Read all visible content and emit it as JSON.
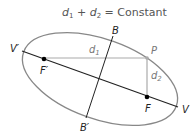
{
  "title": {
    "d1": "d",
    "d1_sub": "1",
    "plus": " + ",
    "d2": "d",
    "d2_sub": "2",
    "rest": " = Constant"
  },
  "labels": {
    "vertex_left": "V′",
    "vertex_right": "V",
    "focus_left": "F′",
    "focus_right": "F",
    "covertex_top": "B",
    "covertex_bottom": "B′",
    "point": "P",
    "d1": "d",
    "d1_sub": "1",
    "d2": "d",
    "d2_sub": "2"
  },
  "colors": {
    "ellipse": "#888888",
    "axes": "#222222",
    "distance_lines": "#aaaaaa",
    "title": "#555555"
  }
}
